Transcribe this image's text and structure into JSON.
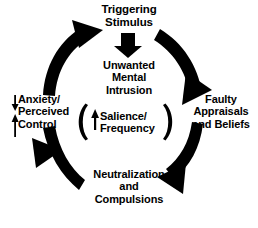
{
  "diagram": {
    "title_text": "OCD Maintenance Cycle",
    "background_color": "#ffffff",
    "ink_color": "#000000",
    "nodes": {
      "triggering_stimulus": "Triggering\nStimulus",
      "unwanted_intrusion": "Unwanted\nMental\nIntrusion",
      "faulty_appraisals": "Faulty\nAppraisals\nand Beliefs",
      "neutralization": "Neutralization\nand\nCompulsions",
      "anxiety_control": "Anxiety/\nPerceived\nControl",
      "salience_frequency": "Salience/\nFrequency"
    },
    "icons": {
      "down_arrow_trigger": "thick-down-arrow-icon",
      "up_arrow_salience": "up-arrow-icon",
      "down_arrow_anxiety": "down-arrow-icon",
      "up_arrow_control": "up-arrow-icon",
      "bracket_left": "left-parenthesis-icon",
      "bracket_right": "right-parenthesis-icon"
    },
    "arcs": [
      {
        "name": "arc-neutralization-to-anxiety",
        "from": "Neutralization and Compulsions",
        "to": "Anxiety/Perceived Control",
        "direction": "counterclockwise-bottom-left"
      },
      {
        "name": "arc-anxiety-to-trigger",
        "from": "Anxiety/Perceived Control",
        "to": "Triggering Stimulus",
        "direction": "clockwise-top-left"
      },
      {
        "name": "arc-trigger-to-appraisals",
        "from": "Triggering Stimulus",
        "to": "Faulty Appraisals and Beliefs",
        "direction": "clockwise-top-right"
      },
      {
        "name": "arc-appraisals-to-neutralization",
        "from": "Faulty Appraisals and Beliefs",
        "to": "Neutralization and Compulsions",
        "direction": "clockwise-bottom-right"
      }
    ]
  }
}
